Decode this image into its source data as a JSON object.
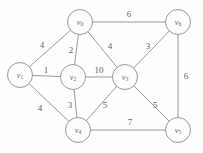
{
  "figure": {
    "name": "weighted-undirected-graph",
    "background_color": "#fefefe",
    "stroke_color": "#8e8e8e",
    "text_color": "#5e5e5e",
    "width": 203,
    "height": 153
  },
  "chart_data": {
    "type": "diagram",
    "graph_type": "weighted-undirected-graph",
    "title": "",
    "xlabel": "",
    "ylabel": "",
    "directed": false,
    "node_count": 7,
    "edge_count": 13,
    "nodes": [
      {
        "id": "v0",
        "base": "v",
        "sub": "0",
        "x": 80,
        "y": 22,
        "r": 12.5
      },
      {
        "id": "v1",
        "base": "v",
        "sub": "1",
        "x": 20,
        "y": 75,
        "r": 12.5
      },
      {
        "id": "v2",
        "base": "v",
        "sub": "2",
        "x": 73,
        "y": 77,
        "r": 12.5
      },
      {
        "id": "v3",
        "base": "v",
        "sub": "3",
        "x": 125,
        "y": 77,
        "r": 12.5
      },
      {
        "id": "v4",
        "base": "v",
        "sub": "4",
        "x": 78,
        "y": 130,
        "r": 12.5
      },
      {
        "id": "v5",
        "base": "v",
        "sub": "5",
        "x": 178,
        "y": 130,
        "r": 12.5
      },
      {
        "id": "v6",
        "base": "v",
        "sub": "6",
        "x": 178,
        "y": 22,
        "r": 12.5
      }
    ],
    "edges": [
      {
        "source": "v0",
        "target": "v6",
        "weight": 6,
        "label_x": 129,
        "label_y": 14
      },
      {
        "source": "v0",
        "target": "v1",
        "weight": 4,
        "label_x": 42,
        "label_y": 45
      },
      {
        "source": "v0",
        "target": "v2",
        "weight": 2,
        "label_x": 71,
        "label_y": 50
      },
      {
        "source": "v0",
        "target": "v3",
        "weight": 4,
        "label_x": 110,
        "label_y": 46
      },
      {
        "source": "v6",
        "target": "v3",
        "weight": 3,
        "label_x": 148,
        "label_y": 46
      },
      {
        "source": "v6",
        "target": "v5",
        "weight": 6,
        "label_x": 186,
        "label_y": 76
      },
      {
        "source": "v1",
        "target": "v2",
        "weight": 1,
        "label_x": 46,
        "label_y": 70
      },
      {
        "source": "v2",
        "target": "v3",
        "weight": 10,
        "label_x": 99,
        "label_y": 70
      },
      {
        "source": "v1",
        "target": "v4",
        "weight": 4,
        "label_x": 40,
        "label_y": 108
      },
      {
        "source": "v2",
        "target": "v4",
        "weight": 3,
        "label_x": 70,
        "label_y": 105
      },
      {
        "source": "v3",
        "target": "v4",
        "weight": 5,
        "label_x": 105,
        "label_y": 105
      },
      {
        "source": "v3",
        "target": "v5",
        "weight": 5,
        "label_x": 155,
        "label_y": 105
      },
      {
        "source": "v4",
        "target": "v5",
        "weight": 7,
        "label_x": 130,
        "label_y": 122
      }
    ]
  }
}
